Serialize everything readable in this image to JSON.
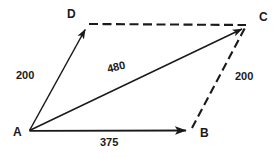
{
  "figure": {
    "type": "vector-parallelogram-diagram",
    "background_color": "#ffffff",
    "stroke_color": "#1a1a1a",
    "text_color": "#1a1a1a",
    "width": 279,
    "height": 158,
    "vertices": [
      {
        "name": "A",
        "label": "A",
        "x": 29,
        "y": 131
      },
      {
        "name": "B",
        "label": "B",
        "x": 191,
        "y": 130
      },
      {
        "name": "C",
        "label": "C",
        "x": 247,
        "y": 25
      },
      {
        "name": "D",
        "label": "D",
        "x": 88,
        "y": 24
      }
    ],
    "edges": [
      {
        "name": "AD",
        "from": "A",
        "to": "D",
        "style": "solid",
        "arrow": true,
        "label": "200"
      },
      {
        "name": "AB",
        "from": "A",
        "to": "B",
        "style": "solid",
        "arrow": true,
        "label": "375"
      },
      {
        "name": "AC",
        "from": "A",
        "to": "C",
        "style": "solid",
        "arrow": true,
        "label": "480"
      },
      {
        "name": "DC",
        "from": "D",
        "to": "C",
        "style": "dashed",
        "arrow": false,
        "label": ""
      },
      {
        "name": "BC",
        "from": "B",
        "to": "C",
        "style": "dashed",
        "arrow": false,
        "label": "200"
      }
    ],
    "labels": {
      "vertex_A": "A",
      "vertex_B": "B",
      "vertex_C": "C",
      "vertex_D": "D",
      "side_AD": "200",
      "side_BC": "200",
      "side_AB": "375",
      "diagonal_AC": "480"
    }
  }
}
